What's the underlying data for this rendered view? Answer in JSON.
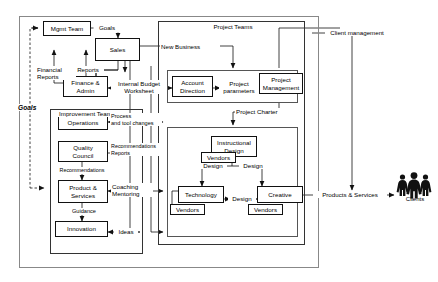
{
  "diagram": {
    "type": "flow-diagram",
    "colors": {
      "line": "#111111",
      "group_border": "#555555",
      "outer_border": "#888888",
      "background": "#ffffff",
      "text": "#000000"
    }
  },
  "groups": {
    "outer_frame": {
      "label": ""
    },
    "improvement_teams": {
      "label": "Improvement Teams"
    },
    "project_teams": {
      "label": "Project Teams"
    },
    "account_band": {
      "label": ""
    },
    "design_band": {
      "label": ""
    }
  },
  "nodes": {
    "mgmt_team": {
      "label": "Mgmt  Team"
    },
    "sales": {
      "label": "Sales"
    },
    "finance_admin": {
      "label": "Finance &\nAdmin"
    },
    "operations": {
      "label": "Operations"
    },
    "quality_council": {
      "label": "Quality\nCouncil"
    },
    "product_services": {
      "label": "Product &\nServices"
    },
    "innovation": {
      "label": "Innovation"
    },
    "account_direction": {
      "label": "Account\nDirection"
    },
    "project_management": {
      "label": "Project\nManagement"
    },
    "instructional_design": {
      "label": "Instructional\nDesign"
    },
    "instructional_vendors": {
      "label": "Vendors"
    },
    "technology": {
      "label": "Technology"
    },
    "technology_vendors": {
      "label": "Vendors"
    },
    "creative": {
      "label": "Creative"
    },
    "creative_vendors": {
      "label": "Vendors"
    }
  },
  "edge_labels": {
    "goals_top": "Goals",
    "goals_left": "Goals",
    "financial_reports": "Financial\nReports",
    "reports": "Reports",
    "internal_budget_worksheet": "Internal Budget\nWorksheet",
    "new_business": "New Business",
    "process_and_tool_changes": "Process\nand tool changes",
    "recommendations_reports": "Recommendations\nReports",
    "recommendations": "Recommendations",
    "coaching_mentoring": "Coaching\nMentoring",
    "guidance": "Guidance",
    "ideas": "Ideas",
    "project_parameters": "Project\nparameters",
    "project_charter": "Project Charter",
    "design_left": "Design",
    "design_right": "Design",
    "design_middle": "Design",
    "client_management": "Client management",
    "products_and_services": "Products & Services"
  },
  "actors": {
    "clients": {
      "label": "Clients",
      "icon": "people-group-icon"
    }
  }
}
